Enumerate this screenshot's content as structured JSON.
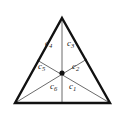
{
  "figure": {
    "name": "triangle-six-regions-diagram",
    "type": "geometric-diagram",
    "colors": {
      "background": "#ffffff",
      "outline": "#111111",
      "cevian": "#5a5a5a",
      "center_dot": "#111111",
      "label_text": "#1a1a1a"
    },
    "geometry": {
      "apex": [
        62,
        18
      ],
      "bottom_left": [
        15,
        103
      ],
      "bottom_right": [
        110,
        103
      ],
      "center_point": [
        62,
        73
      ],
      "left_side_split": [
        37,
        60
      ],
      "right_side_split": [
        87,
        59
      ],
      "base_split": [
        62,
        103
      ],
      "outline_width": 2.4,
      "cevian_width": 0.9,
      "center_dot_radius": 2.6
    },
    "labels": [
      {
        "id": "c1",
        "text": "c",
        "sub": "1",
        "x": 69,
        "y": 87
      },
      {
        "id": "c2",
        "text": "c",
        "sub": "2",
        "x": 72,
        "y": 67
      },
      {
        "id": "c3",
        "text": "c",
        "sub": "3",
        "x": 67,
        "y": 44
      },
      {
        "id": "c4",
        "text": "c",
        "sub": "4",
        "x": 45,
        "y": 44
      },
      {
        "id": "c5",
        "text": "c",
        "sub": "5",
        "x": 38,
        "y": 67
      },
      {
        "id": "c6",
        "text": "c",
        "sub": "6",
        "x": 50,
        "y": 87
      }
    ]
  }
}
